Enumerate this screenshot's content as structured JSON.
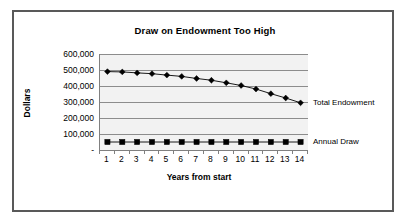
{
  "chart_data": {
    "type": "line",
    "title": "Draw on Endowment Too High",
    "xlabel": "Years from start",
    "ylabel": "Dollars",
    "categories": [
      1,
      2,
      3,
      4,
      5,
      6,
      7,
      8,
      9,
      10,
      11,
      12,
      13,
      14
    ],
    "x_tick_labels": [
      "1",
      "2",
      "3",
      "4",
      "5",
      "6",
      "7",
      "8",
      "9",
      "10",
      "11",
      "12",
      "13",
      "14"
    ],
    "y_tick_labels": [
      "600,000",
      "500,000",
      "400,000",
      "300,000",
      "200,000",
      "100,000",
      "-"
    ],
    "y_tick_values": [
      600000,
      500000,
      400000,
      300000,
      200000,
      100000,
      0
    ],
    "ylim": [
      0,
      600000
    ],
    "grid": "horizontal",
    "legend_position": "end-of-line",
    "plot_background": "#f2f2f2",
    "series": [
      {
        "name": "Total Endowment",
        "marker": "diamond",
        "color": "#000000",
        "values": [
          490000,
          488000,
          482000,
          477000,
          468000,
          460000,
          447000,
          436000,
          420000,
          403000,
          381000,
          352000,
          325000,
          295000
        ]
      },
      {
        "name": "Annual Draw",
        "marker": "square",
        "color": "#000000",
        "values": [
          50000,
          50000,
          50000,
          50000,
          50000,
          50000,
          50000,
          50000,
          50000,
          50000,
          50000,
          50000,
          50000,
          50000
        ]
      }
    ]
  },
  "chart": {
    "title": "Draw on Endowment Too High",
    "y_axis_title": "Dollars",
    "x_axis_title": "Years from start",
    "series_label_1": "Total Endowment",
    "series_label_2": "Annual Draw"
  }
}
